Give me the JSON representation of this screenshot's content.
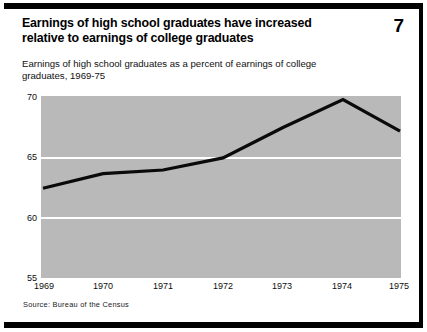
{
  "figure": {
    "number": "7",
    "title": "Earnings of high school graduates have increased relative to earnings of college graduates",
    "subtitle": "Earnings of high school graduates as a percent of earnings of college graduates, 1969-75",
    "source": "Source: Bureau of the Census"
  },
  "chart_data": {
    "type": "line",
    "title": "Earnings of high school graduates have increased relative to earnings of college graduates",
    "subtitle": "Earnings of high school graduates as a percent of earnings of college graduates, 1969-75",
    "xlabel": "",
    "ylabel": "",
    "categories": [
      "1969",
      "1970",
      "1971",
      "1972",
      "1973",
      "1974",
      "1975"
    ],
    "x": [
      1969,
      1970,
      1971,
      1972,
      1973,
      1974,
      1975
    ],
    "values": [
      62.4,
      63.6,
      63.9,
      64.9,
      67.4,
      69.7,
      67.1
    ],
    "series": [
      {
        "name": "High school graduates' earnings as a percent of college graduates' earnings",
        "values": [
          62.4,
          63.6,
          63.9,
          64.9,
          67.4,
          69.7,
          67.1
        ]
      }
    ],
    "ylim": [
      55,
      70
    ],
    "yticks": [
      55,
      60,
      65,
      70
    ],
    "ytick_labels": [
      "55",
      "60",
      "65",
      "70"
    ],
    "xtick_labels": [
      "1969",
      "1970",
      "1971",
      "1972",
      "1973",
      "1974",
      "1975"
    ],
    "grid": true,
    "gridlines_at": [
      60,
      65
    ],
    "legend": null,
    "legend_position": "none",
    "line_color": "#000000",
    "plot_background": "#b9b9b9",
    "gridline_color": "#ffffff"
  }
}
